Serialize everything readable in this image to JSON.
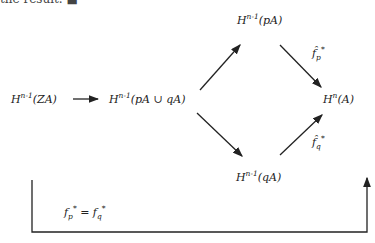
{
  "top_fragment": "the result. ■",
  "diagram": {
    "nodes": {
      "h_ZA": {
        "base": "H",
        "sup": "n-1",
        "arg": "(ZA)"
      },
      "h_union": {
        "base": "H",
        "sup": "n-1",
        "arg": "(pA ∪ qA)"
      },
      "h_pA": {
        "base": "H",
        "sup": "n-1",
        "arg": "(pA)"
      },
      "h_qA": {
        "base": "H",
        "sup": "n-1",
        "arg": "(qA)"
      },
      "h_A": {
        "base": "H",
        "sup": "n",
        "arg": "(A)"
      }
    },
    "labels": {
      "fp_hat": {
        "base": "f̂",
        "sub": "p",
        "sup": "*"
      },
      "fq_hat": {
        "base": "f̂",
        "sub": "q",
        "sup": "*"
      },
      "bottom": {
        "lhs_base": "f",
        "lhs_sub": "p",
        "lhs_sup": "*",
        "eq": " = ",
        "rhs_base": "f",
        "rhs_sub": "q",
        "rhs_sup": "*"
      }
    }
  }
}
